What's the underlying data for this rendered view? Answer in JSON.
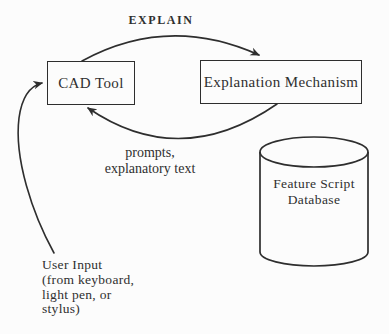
{
  "colors": {
    "background": "#fcfcfc",
    "line": "#2e2e2e",
    "text": "#2f2f2f"
  },
  "nodes": {
    "cad_tool": {
      "label": "CAD Tool"
    },
    "explanation_mechanism": {
      "label": "Explanation Mechanism"
    },
    "feature_script_database": {
      "lines": [
        "Feature Script",
        "Database"
      ]
    }
  },
  "edges": {
    "explain": {
      "label": "EXPLAIN"
    },
    "prompts": {
      "lines": [
        "prompts,",
        "explanatory text"
      ]
    },
    "user_input": {
      "lines": [
        "User Input",
        "(from keyboard,",
        "light pen, or",
        "stylus)"
      ]
    }
  }
}
